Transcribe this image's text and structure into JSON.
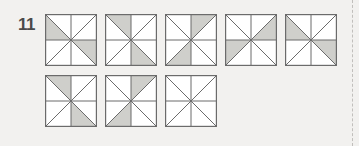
{
  "page": {
    "background_color": "#f2f1ef",
    "right_margin_rule": "dashed-vertical-line"
  },
  "question": {
    "number": "11",
    "figure_type": "pinwheel-squares-grid",
    "shape_description": "square divided by two diagonals and a vertical and horizontal midline into 8 triangles"
  },
  "figure": {
    "colors": {
      "shaded_fill": "#cfcfcb",
      "unshaded_fill": "#ffffff",
      "stroke": "#6b6b6b",
      "border": "#6b6b6b"
    },
    "triangle_order": [
      "n-left",
      "n-right",
      "e-upper",
      "e-lower",
      "s-right",
      "s-left",
      "w-lower",
      "w-upper"
    ],
    "rows": [
      {
        "label": "row-1",
        "squares": [
          {
            "name": "square-1",
            "shaded": [
              "w-upper",
              "e-lower"
            ]
          },
          {
            "name": "square-2",
            "shaded": [
              "n-left",
              "s-right"
            ]
          },
          {
            "name": "square-3",
            "shaded": [
              "n-right",
              "s-left"
            ]
          },
          {
            "name": "square-4",
            "shaded": [
              "e-upper",
              "w-lower"
            ]
          },
          {
            "name": "square-5",
            "shaded": [
              "w-upper",
              "e-lower"
            ]
          }
        ]
      },
      {
        "label": "row-2",
        "squares": [
          {
            "name": "square-6",
            "shaded": [
              "n-left",
              "s-right"
            ]
          },
          {
            "name": "square-7",
            "shaded": [
              "n-right",
              "s-left"
            ]
          },
          {
            "name": "square-8",
            "shaded": []
          }
        ]
      }
    ]
  }
}
